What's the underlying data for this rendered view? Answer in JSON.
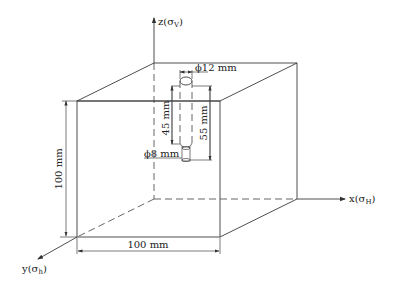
{
  "diagram": {
    "type": "isometric cube specimen with borehole",
    "axes": {
      "z": {
        "label": "z",
        "stress": "σ",
        "subscript": "V"
      },
      "x": {
        "label": "x",
        "stress": "σ",
        "subscript": "H"
      },
      "y": {
        "label": "y",
        "stress": "σ",
        "subscript": "h"
      }
    },
    "dimensions": {
      "height": "100 mm",
      "width": "100 mm",
      "hole_top_diameter": "ϕ12 mm",
      "hole_bottom_diameter": "ϕ8 mm",
      "upper_hole_depth": "45 mm",
      "total_hole_depth": "55 mm"
    },
    "colors": {
      "line": "#3a3a3a",
      "background": "#ffffff"
    }
  }
}
